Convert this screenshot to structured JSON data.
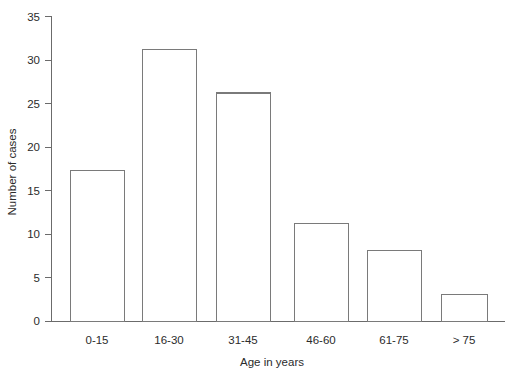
{
  "chart_data": {
    "type": "bar",
    "title": "",
    "subtitle": "",
    "xlabel": "Age in years",
    "ylabel": "Number of cases",
    "categories": [
      "0-15",
      "16-30",
      "31-45",
      "46-60",
      "61-75",
      "> 75"
    ],
    "values": [
      17.3,
      31.2,
      26.2,
      11.2,
      8.1,
      3.1
    ],
    "ylim": [
      0,
      35
    ],
    "yticks": [
      0,
      5,
      10,
      15,
      20,
      25,
      30,
      35
    ],
    "ytick_labels": [
      "0",
      "5",
      "10",
      "15",
      "20",
      "25",
      "30",
      "35"
    ],
    "grid": false,
    "legend": null,
    "legend_position": "none",
    "series": [
      {
        "name": "Number of cases",
        "values": [
          17.3,
          31.2,
          26.2,
          11.2,
          8.1,
          3.1
        ]
      }
    ],
    "colors": {
      "bar_fill": "#ffffff",
      "bar_stroke": "#7a7a7a",
      "axis": "#6b6b6b",
      "text": "#2b2b2b",
      "background": "#ffffff"
    }
  },
  "labels": {
    "y_axis_title": "Number of cases",
    "x_axis_title": "Age in years",
    "y_ticks": [
      "35",
      "30",
      "25",
      "20",
      "15",
      "10",
      "5",
      "0"
    ],
    "x_ticks": [
      "0-15",
      "16-30",
      "31-45",
      "46-60",
      "61-75",
      "> 75"
    ]
  }
}
